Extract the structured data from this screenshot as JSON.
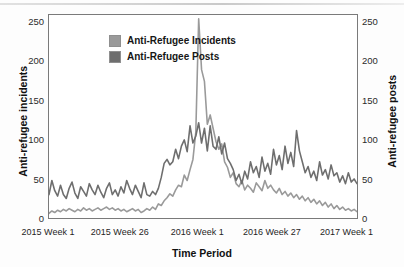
{
  "chart_data": {
    "type": "line",
    "title": "",
    "xlabel": "Time Period",
    "ylabel": "Anti-refugee incidents",
    "y2label": "Anti-refugee posts",
    "grid": false,
    "legend_position": "top-left",
    "ylim": [
      0,
      260
    ],
    "y2lim": [
      0,
      260
    ],
    "yticks": [
      0,
      50,
      100,
      150,
      200,
      250
    ],
    "y2ticks": [
      0,
      50,
      100,
      150,
      200,
      250
    ],
    "xtick_labels": [
      "2015 Week 1",
      "2015 Week 26",
      "2016 Week 1",
      "2016 Week 27",
      "2017 Week 1"
    ],
    "xtick_positions": [
      0,
      25,
      52,
      78,
      104
    ],
    "xlim": [
      0,
      108
    ],
    "colors": {
      "incidents": "#9a9a9a",
      "posts": "#6e6e6e",
      "frame": "#7a7a7a",
      "text": "#1a1a1a",
      "background": "#ffffff"
    },
    "series": [
      {
        "name": "Anti-Refugee Incidents",
        "axis": "right",
        "color": "#9a9a9a",
        "values": [
          6,
          9,
          7,
          10,
          8,
          11,
          9,
          12,
          10,
          8,
          11,
          9,
          13,
          10,
          12,
          9,
          11,
          13,
          10,
          12,
          14,
          11,
          13,
          10,
          12,
          9,
          11,
          8,
          10,
          12,
          9,
          11,
          7,
          9,
          12,
          10,
          14,
          11,
          18,
          16,
          22,
          26,
          31,
          28,
          36,
          42,
          40,
          55,
          48,
          62,
          75,
          110,
          255,
          190,
          175,
          120,
          132,
          115,
          98,
          88,
          95,
          72,
          65,
          52,
          58,
          44,
          40,
          48,
          36,
          42,
          38,
          33,
          45,
          40,
          35,
          48,
          38,
          42,
          36,
          32,
          38,
          30,
          34,
          28,
          32,
          26,
          30,
          24,
          28,
          22,
          26,
          20,
          24,
          18,
          22,
          16,
          20,
          14,
          18,
          12,
          16,
          11,
          14,
          10,
          12,
          9,
          11,
          8
        ]
      },
      {
        "name": "Anti-Refugee Posts",
        "axis": "left",
        "color": "#6e6e6e",
        "values": [
          30,
          48,
          35,
          28,
          42,
          30,
          25,
          38,
          46,
          32,
          25,
          40,
          34,
          28,
          44,
          36,
          30,
          42,
          33,
          26,
          38,
          45,
          30,
          36,
          28,
          40,
          32,
          48,
          38,
          30,
          42,
          34,
          26,
          45,
          30,
          28,
          34,
          30,
          38,
          52,
          70,
          75,
          68,
          72,
          88,
          76,
          92,
          100,
          85,
          118,
          96,
          105,
          122,
          96,
          115,
          86,
          118,
          92,
          88,
          104,
          82,
          96,
          76,
          70,
          62,
          48,
          56,
          44,
          60,
          50,
          72,
          58,
          66,
          52,
          78,
          60,
          70,
          56,
          88,
          68,
          80,
          62,
          92,
          70,
          84,
          66,
          112,
          86,
          72,
          58,
          66,
          52,
          60,
          48,
          72,
          55,
          62,
          50,
          68,
          54,
          58,
          46,
          54,
          44,
          58,
          46,
          50,
          44
        ]
      }
    ]
  }
}
